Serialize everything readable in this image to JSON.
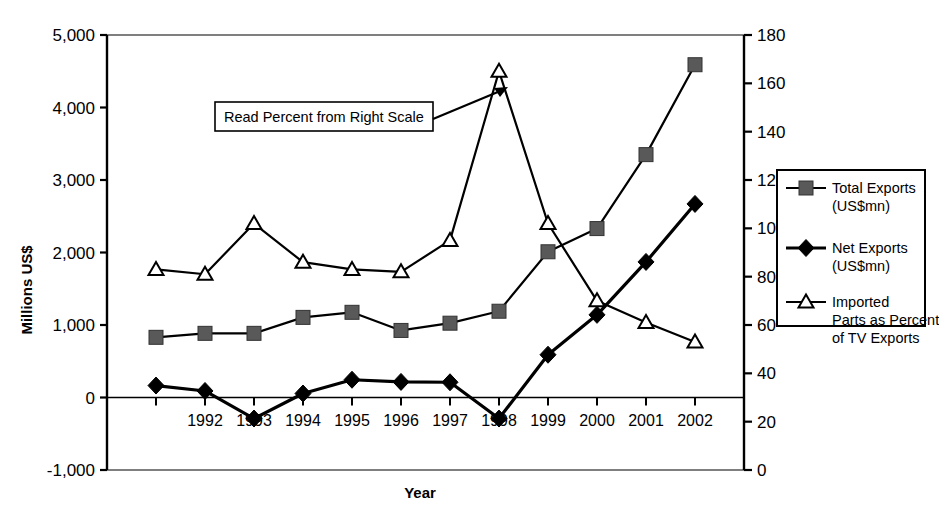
{
  "chart_data": {
    "type": "line",
    "title": "",
    "xlabel": "Year",
    "ylabel": "Millions US$",
    "y2label": "",
    "grid": false,
    "legend_position": "right",
    "categories": [
      "1991",
      "1992",
      "1993",
      "1994",
      "1995",
      "1996",
      "1997",
      "1998",
      "1999",
      "2000",
      "2001",
      "2002"
    ],
    "ylim": [
      -1000,
      5000
    ],
    "y2lim": [
      0,
      180
    ],
    "yticks": [
      "5,000",
      "4,000",
      "3,000",
      "2,000",
      "1,000",
      "0",
      "-1,000"
    ],
    "ytick_values": [
      5000,
      4000,
      3000,
      2000,
      1000,
      0,
      -1000
    ],
    "y2ticks": [
      "180",
      "160",
      "140",
      "120",
      "100",
      "80",
      "60",
      "40",
      "20",
      "0"
    ],
    "y2tick_values": [
      180,
      160,
      140,
      120,
      100,
      80,
      60,
      40,
      20,
      0
    ],
    "series": [
      {
        "name": "Total Exports (US$mn)",
        "legend_label_line1": "Total Exports",
        "legend_label_line2": "(US$mn)",
        "marker": "square",
        "axis": "left",
        "values": [
          830,
          885,
          885,
          1105,
          1175,
          925,
          1025,
          1190,
          2010,
          2330,
          3350,
          4590
        ]
      },
      {
        "name": "Net Exports (US$mn)",
        "legend_label_line1": "Net Exports",
        "legend_label_line2": "(US$mn)",
        "marker": "diamond",
        "axis": "left",
        "values": [
          165,
          90,
          -290,
          55,
          245,
          215,
          210,
          -290,
          590,
          1140,
          1870,
          2670
        ]
      },
      {
        "name": "Imported Parts as Percent of TV Exports",
        "legend_label_line1": "Imported",
        "legend_label_line2": "Parts as Percent",
        "legend_label_line3": "of TV Exports",
        "marker": "triangle",
        "axis": "right",
        "values": [
          83,
          81,
          102,
          86,
          83,
          82,
          95,
          165,
          102,
          70,
          61,
          53
        ]
      }
    ],
    "annotations": [
      {
        "text": "Read Percent from Right Scale",
        "type": "boxed-callout-with-arrow",
        "points_to": "1998 peak of Imported Parts as Percent of TV Exports"
      }
    ]
  },
  "colors": {
    "axis": "#000000",
    "series_line": "#000000",
    "marker_square_fill": "#595959",
    "marker_diamond_fill": "#000000",
    "marker_triangle_fill": "#ffffff",
    "background": "#ffffff"
  }
}
